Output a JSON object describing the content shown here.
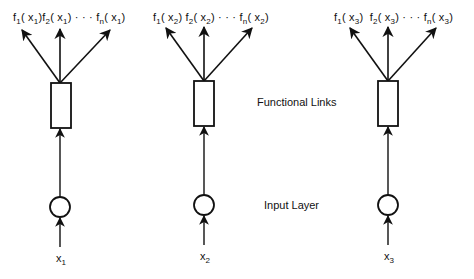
{
  "labels": {
    "functional_links": "Functional Links",
    "input_layer": "Input Layer"
  },
  "columns": [
    {
      "input": {
        "var": "x",
        "sub": "1"
      },
      "outputs": [
        {
          "f": "f",
          "fsub": "1",
          "arg": "( x",
          "argsub": "1",
          "close": ")"
        },
        {
          "f": "f",
          "fsub": "2",
          "arg": "( x",
          "argsub": "1",
          "close": ")"
        },
        {
          "sep": "· · ·"
        },
        {
          "f": "f",
          "fsub": "n",
          "arg": "( x",
          "argsub": "1",
          "close": ")"
        }
      ]
    },
    {
      "input": {
        "var": "x",
        "sub": "2"
      },
      "outputs": [
        {
          "f": "f",
          "fsub": "1",
          "arg": "( x",
          "argsub": "2",
          "close": ")"
        },
        {
          "f": "f",
          "fsub": "2",
          "arg": "( x",
          "argsub": "2",
          "close": ")"
        },
        {
          "sep": "· · ·"
        },
        {
          "f": "f",
          "fsub": "n",
          "arg": "( x",
          "argsub": "2",
          "close": ")"
        }
      ]
    },
    {
      "input": {
        "var": "x",
        "sub": "3"
      },
      "outputs": [
        {
          "f": "f",
          "fsub": "1",
          "arg": "( x",
          "argsub": "3",
          "close": ")"
        },
        {
          "f": "f",
          "fsub": "2",
          "arg": "( x",
          "argsub": "3",
          "close": ")"
        },
        {
          "sep": "· · ·"
        },
        {
          "f": "f",
          "fsub": "n",
          "arg": "( x",
          "argsub": "3",
          "close": ")"
        }
      ]
    }
  ],
  "colors": {
    "stroke": "#111111",
    "background": "#ffffff"
  }
}
